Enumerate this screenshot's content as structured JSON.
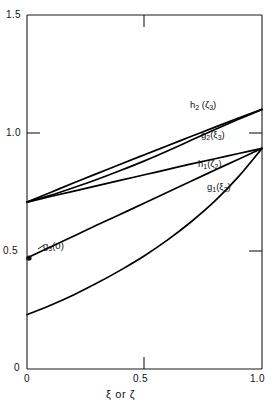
{
  "chart_data": {
    "type": "line",
    "title": "",
    "subtitle": "",
    "xlabel": "ξ or ζ",
    "ylabel": "",
    "xlim": [
      0,
      1.0
    ],
    "ylim": [
      0,
      1.5
    ],
    "grid": false,
    "legend_position": "inline-annotations",
    "xticks": [
      0,
      0.5,
      1.0
    ],
    "xticklabels": [
      "0",
      "0.5",
      "1.0"
    ],
    "yticks": [
      0,
      0.5,
      1.0,
      1.5
    ],
    "yticklabels": [
      "0",
      "0.5",
      "1.0",
      "1.5"
    ],
    "series": [
      {
        "name": "h₂ (ζ₃)",
        "label_html": "h<sub>2</sub> (ζ<sub>3</sub>)",
        "color": "#000000",
        "x": [
          0.0,
          0.1,
          0.2,
          0.3,
          0.4,
          0.5,
          0.6,
          0.7,
          0.8,
          0.9,
          1.0
        ],
        "values": [
          0.707,
          0.748,
          0.789,
          0.829,
          0.869,
          0.908,
          0.947,
          0.986,
          1.025,
          1.063,
          1.1
        ]
      },
      {
        "name": "g₂ (ξ₃)",
        "label_html": "g<sub>2</sub>(ξ<sub>3</sub>)",
        "color": "#000000",
        "x": [
          0.0,
          0.1,
          0.2,
          0.3,
          0.4,
          0.5,
          0.6,
          0.7,
          0.8,
          0.9,
          1.0
        ],
        "values": [
          0.707,
          0.736,
          0.769,
          0.804,
          0.842,
          0.882,
          0.925,
          0.97,
          1.015,
          1.058,
          1.1
        ]
      },
      {
        "name": "h₁ (ζ₂)",
        "label_html": "h<sub>1</sub>(ζ<sub>2</sub>)",
        "color": "#000000",
        "x": [
          0.0,
          0.1,
          0.2,
          0.3,
          0.4,
          0.5,
          0.6,
          0.7,
          0.8,
          0.9,
          1.0
        ],
        "values": [
          0.707,
          0.731,
          0.754,
          0.777,
          0.8,
          0.823,
          0.846,
          0.869,
          0.891,
          0.913,
          0.935
        ]
      },
      {
        "name": "g₁ (ξ₂)",
        "label_html": "g<sub>1</sub>(ξ<sub>2</sub>)",
        "color": "#000000",
        "x": [
          0.0,
          0.1,
          0.2,
          0.3,
          0.4,
          0.5,
          0.6,
          0.7,
          0.8,
          0.9,
          1.0
        ],
        "values": [
          0.23,
          0.27,
          0.315,
          0.365,
          0.42,
          0.48,
          0.548,
          0.625,
          0.712,
          0.815,
          0.935
        ]
      },
      {
        "name": "g₃ (0) branch",
        "label_html": "g<sub>3</sub>(0)",
        "color": "#000000",
        "x": [
          0.0,
          0.1,
          0.2,
          0.3,
          0.4,
          0.5,
          0.6,
          0.7,
          0.8,
          0.9,
          1.0
        ],
        "values": [
          0.47,
          0.517,
          0.564,
          0.611,
          0.657,
          0.703,
          0.75,
          0.797,
          0.843,
          0.889,
          0.935
        ]
      }
    ],
    "annotations": [
      {
        "name": "g3-zero-marker",
        "label": "g₃(0)",
        "label_html": "g<sub>3</sub>(0)",
        "x": 0.0,
        "y": 0.47,
        "marker": "filled-circle"
      }
    ]
  },
  "axes": {
    "x_title": "ξ or ζ",
    "x_tick_labels": {
      "t0": "0",
      "t1": "0.5",
      "t2": "1.0"
    },
    "y_tick_labels": {
      "t0": "0",
      "t1": "0.5",
      "t2": "1.0",
      "t3": "1.5"
    }
  },
  "labels": {
    "h2": "h₂ (ζ₃)",
    "g2": "g₂(ξ₃)",
    "h1": "h₁(ζ₂)",
    "g1": "g₁(ξ₂)",
    "g3": "g₃(0)"
  },
  "colors": {
    "curve": "#000000",
    "axis": "#1a1a1a",
    "background": "#ffffff",
    "text": "#111111"
  }
}
